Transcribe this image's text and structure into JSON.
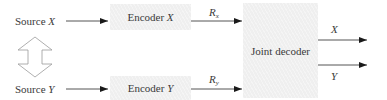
{
  "diagram": {
    "type": "block-diagram",
    "title": "",
    "sources": [
      {
        "id": "source-x",
        "prefix": "Source ",
        "var": "X"
      },
      {
        "id": "source-y",
        "prefix": "Source ",
        "var": "Y"
      }
    ],
    "encoders": [
      {
        "id": "encoder-x",
        "prefix": "Encoder ",
        "var": "X"
      },
      {
        "id": "encoder-y",
        "prefix": "Encoder ",
        "var": "Y"
      }
    ],
    "rates": [
      {
        "id": "rate-x",
        "symbol": "R",
        "subscript": "x"
      },
      {
        "id": "rate-y",
        "symbol": "R",
        "subscript": "y"
      }
    ],
    "decoder": {
      "id": "joint-decoder",
      "label": "Joint decoder"
    },
    "outputs": [
      {
        "id": "output-x",
        "var": "X"
      },
      {
        "id": "output-y",
        "var": "Y"
      }
    ],
    "correlation_arrow": {
      "type": "double-headed",
      "between": [
        "Source X",
        "Source Y"
      ]
    },
    "edges": [
      {
        "from": "Source X",
        "to": "Encoder X"
      },
      {
        "from": "Encoder X",
        "to": "Joint decoder",
        "label": "R_x"
      },
      {
        "from": "Source Y",
        "to": "Encoder Y"
      },
      {
        "from": "Encoder Y",
        "to": "Joint decoder",
        "label": "R_y"
      },
      {
        "from": "Joint decoder",
        "to": "X"
      },
      {
        "from": "Joint decoder",
        "to": "Y"
      }
    ],
    "colors": {
      "box_fill": "#efefef",
      "line": "#2a2a2a",
      "text": "#3a3a3a",
      "outline_arrow": "#9a9a9a"
    }
  }
}
